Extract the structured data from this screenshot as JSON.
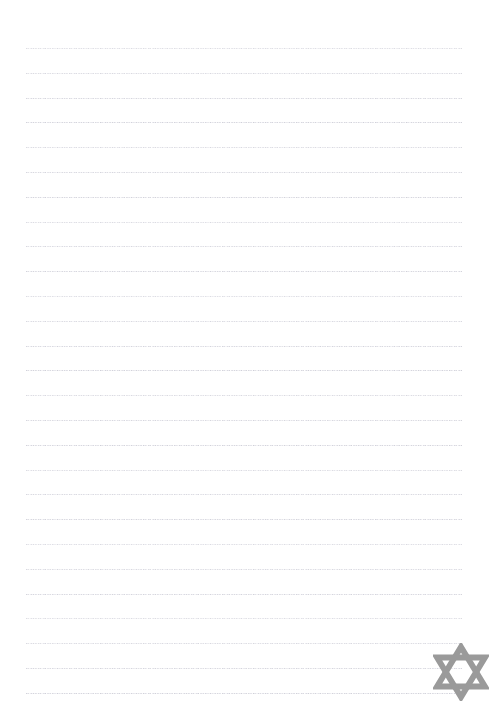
{
  "page": {
    "kind": "lined-notepaper-page",
    "width": 497,
    "height": 718,
    "background_color": "#ffffff",
    "text_content": "",
    "written_text_present": false
  },
  "ruled_lines": {
    "label": "ruled writing lines",
    "count": 27,
    "style": "dotted",
    "color": "#c9c9d2",
    "thickness_px": 1,
    "dot_pitch_px": 2.4,
    "left_x": 26,
    "right_x": 462,
    "length_px": 436,
    "first_line_y": 48,
    "spacing_px": 24.8,
    "y_positions": [
      48.0,
      72.8,
      97.6,
      122.4,
      147.2,
      172.0,
      196.8,
      221.6,
      246.4,
      271.2,
      296.0,
      320.8,
      345.6,
      370.4,
      395.2,
      420.0,
      444.8,
      469.6,
      494.4,
      519.2,
      544.0,
      568.8,
      593.6,
      618.4,
      643.2,
      668.0,
      692.8
    ]
  },
  "emblem": {
    "name": "star-of-david-icon",
    "description": "Interwoven Star of David hexagram watermark",
    "color": "#9a9a9a",
    "x": 433,
    "y": 643,
    "width": 56,
    "height": 58,
    "stroke_width_px": 6,
    "position_label": "bottom-right"
  }
}
